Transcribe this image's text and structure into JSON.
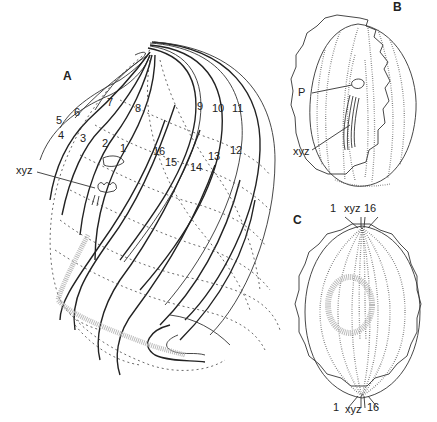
{
  "figure": {
    "panels": [
      {
        "id": "A",
        "label": "A"
      },
      {
        "id": "B",
        "label": "B"
      },
      {
        "id": "C",
        "label": "C"
      }
    ],
    "panel_a": {
      "row_numbers": [
        "1",
        "2",
        "3",
        "4",
        "5",
        "6",
        "7",
        "8",
        "9",
        "10",
        "11",
        "12",
        "13",
        "14",
        "15",
        "16"
      ],
      "xyz_label": "xyz"
    },
    "panel_b": {
      "p_label": "P",
      "xyz_label": "xyz"
    },
    "panel_c": {
      "top_labels": {
        "left": "1",
        "middle": "xyz",
        "right": "16"
      },
      "bottom_labels": {
        "left": "1",
        "middle": "xyz",
        "right": "16"
      }
    }
  }
}
